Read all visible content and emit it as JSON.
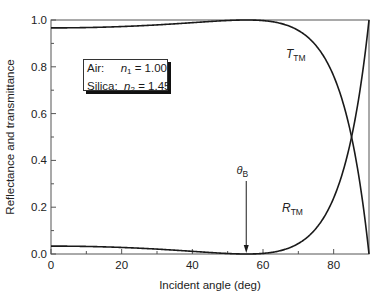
{
  "chart_data": {
    "type": "line",
    "title": "",
    "xlabel": "Incident angle (deg)",
    "ylabel": "Reflectance and transmittance",
    "xlim": [
      0,
      90
    ],
    "ylim": [
      0.0,
      1.0
    ],
    "x_ticks": [
      0,
      20,
      40,
      60,
      80
    ],
    "x_tick_labels": [
      "0",
      "20",
      "40",
      "60",
      "80"
    ],
    "x_minor_ticks": [
      10,
      30,
      50,
      70
    ],
    "y_ticks": [
      0.0,
      0.2,
      0.4,
      0.6,
      0.8,
      1.0
    ],
    "y_tick_labels": [
      "0.0",
      "0.2",
      "0.4",
      "0.6",
      "0.8",
      "1.0"
    ],
    "y_minor_ticks": [
      0.1,
      0.3,
      0.5,
      0.7,
      0.9
    ],
    "grid": false,
    "x": [
      0,
      10,
      20,
      30,
      40,
      45,
      50,
      55.4,
      60,
      65,
      70,
      75,
      80,
      82,
      84,
      85,
      86,
      87,
      88,
      89,
      90
    ],
    "series": [
      {
        "name": "R_TM",
        "label_main": "R",
        "label_sub": "TM",
        "values": [
          0.0337,
          0.0322,
          0.0278,
          0.0208,
          0.0117,
          0.0069,
          0.0031,
          0.0,
          0.0027,
          0.0138,
          0.0396,
          0.0946,
          0.2268,
          0.313,
          0.4259,
          0.4914,
          0.5652,
          0.6705,
          0.77,
          0.8841,
          1.0
        ]
      },
      {
        "name": "T_TM",
        "label_main": "T",
        "label_sub": "TM",
        "values": [
          0.9663,
          0.9678,
          0.9722,
          0.9792,
          0.9883,
          0.9931,
          0.9969,
          1.0,
          0.9973,
          0.9862,
          0.9604,
          0.9054,
          0.7732,
          0.687,
          0.5741,
          0.5086,
          0.4348,
          0.3295,
          0.23,
          0.1159,
          0.0
        ]
      }
    ],
    "annotations": [
      {
        "text": "θ",
        "sub": "B",
        "type": "arrow",
        "x": 55.4,
        "description": "Brewster angle"
      }
    ],
    "legend": {
      "position": "upper-left inset box",
      "rows": [
        {
          "medium": "Air:",
          "symbol": "n",
          "sub": "1",
          "value": "= 1.00"
        },
        {
          "medium": "Silica:",
          "symbol": "n",
          "sub": "2",
          "value": "= 1.45"
        }
      ]
    }
  },
  "colors": {
    "line": "#1a1a1a",
    "frame": "#555555",
    "background": "#ffffff"
  }
}
